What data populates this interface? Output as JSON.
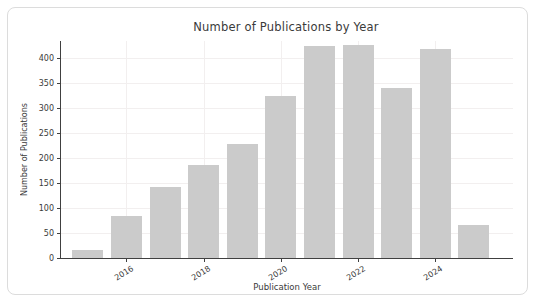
{
  "chart_data": {
    "type": "bar",
    "title": "Number of Publications by Year",
    "xlabel": "Publication Year",
    "ylabel": "Number of Publications",
    "categories": [
      2015,
      2016,
      2017,
      2018,
      2019,
      2020,
      2021,
      2022,
      2023,
      2024,
      2025
    ],
    "values": [
      17,
      85,
      142,
      186,
      228,
      324,
      424,
      426,
      340,
      418,
      67
    ],
    "yticks": [
      0,
      50,
      100,
      150,
      200,
      250,
      300,
      350,
      400
    ],
    "xtick_labels_shown": [
      "2016",
      "2018",
      "2020",
      "2022",
      "2024"
    ],
    "ylim": [
      0,
      434
    ],
    "grid": true,
    "legend": "none",
    "bar_color": "#cbcbcb",
    "grid_color": "#f2efef",
    "axis_color": "#404040",
    "text_color": "#3a3a3a",
    "xtick_rotation_deg": 32
  }
}
